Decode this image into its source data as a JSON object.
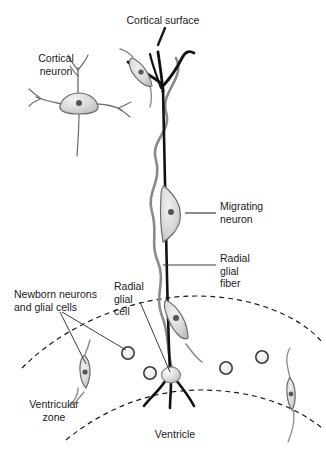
{
  "figure": {
    "type": "biological-schematic",
    "width": 326,
    "height": 450,
    "background_color": "#ffffff"
  },
  "labels": {
    "cortical_surface": "Cortical surface",
    "cortical_neuron": "Cortical\nneuron",
    "migrating_neuron": "Migrating\nneuron",
    "radial_glial_fiber": "Radial\nglial\nfiber",
    "newborn_cells": "Newborn neurons\nand glial cells",
    "radial_glial_cell": "Radial\nglial\ncell",
    "ventricular_zone": "Ventricular\nzone",
    "ventricle": "Ventricle"
  },
  "colors": {
    "text": "#1a1a1a",
    "fiber_dark": "#111111",
    "fiber_gray": "#8a8a8a",
    "cell_outline": "#6b6b6b",
    "cell_fill_light": "#e8e8e8",
    "cell_fill_mid": "#d2d2d2",
    "nucleus": "#555555",
    "leader_line": "#3c3c3c",
    "dashed_arc": "#1a1a1a"
  },
  "structures": {
    "radial_glial_fiber_count": 1,
    "migrating_neurons": 3,
    "progenitor_circles": 4,
    "cortical_neurons": 1,
    "bipolar_cells": 3,
    "dashed_arcs": 2
  }
}
